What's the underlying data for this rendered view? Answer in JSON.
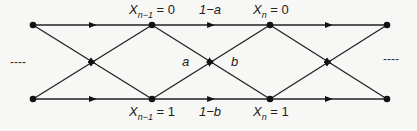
{
  "diagram": {
    "type": "state-transition-trellis",
    "colors": {
      "line": "#222222",
      "node": "#111111",
      "background": "#f7f7f5"
    },
    "nodes": [
      {
        "id": "left-top",
        "x": 33,
        "y": 25
      },
      {
        "id": "left-bottom",
        "x": 33,
        "y": 99
      },
      {
        "id": "prev-0",
        "x": 152,
        "y": 25,
        "label_var": "X",
        "label_sub": "n−1",
        "label_rest": " = 0"
      },
      {
        "id": "prev-1",
        "x": 152,
        "y": 99,
        "label_var": "X",
        "label_sub": "n−1",
        "label_rest": " = 1"
      },
      {
        "id": "curr-0",
        "x": 270,
        "y": 25,
        "label_var": "X",
        "label_sub": "n",
        "label_rest": " = 0"
      },
      {
        "id": "curr-1",
        "x": 270,
        "y": 99,
        "label_var": "X",
        "label_sub": "n",
        "label_rest": " = 1"
      },
      {
        "id": "right-top",
        "x": 387,
        "y": 25
      },
      {
        "id": "right-bottom",
        "x": 387,
        "y": 99
      }
    ],
    "edges": [
      {
        "from": "left-top",
        "to": "prev-0"
      },
      {
        "from": "left-top",
        "to": "prev-1"
      },
      {
        "from": "left-bottom",
        "to": "prev-0"
      },
      {
        "from": "left-bottom",
        "to": "prev-1"
      },
      {
        "from": "prev-0",
        "to": "curr-0",
        "label": "1−a"
      },
      {
        "from": "prev-0",
        "to": "curr-1",
        "label": "a"
      },
      {
        "from": "prev-1",
        "to": "curr-0",
        "label": "b"
      },
      {
        "from": "prev-1",
        "to": "curr-1",
        "label": "1−b"
      },
      {
        "from": "curr-0",
        "to": "right-top"
      },
      {
        "from": "curr-0",
        "to": "right-bottom"
      },
      {
        "from": "curr-1",
        "to": "right-top"
      },
      {
        "from": "curr-1",
        "to": "right-bottom"
      }
    ],
    "labels": {
      "prev0": {
        "var": "X",
        "sub": "n−1",
        "rest": " = 0"
      },
      "prev1": {
        "var": "X",
        "sub": "n−1",
        "rest": " = 1"
      },
      "curr0": {
        "var": "X",
        "sub": "n",
        "rest": " = 0"
      },
      "curr1": {
        "var": "X",
        "sub": "n",
        "rest": " = 1"
      },
      "edge_top": "1−a",
      "edge_bottom": "1−b",
      "edge_cross_a": "a",
      "edge_cross_b": "b",
      "left_continuation": "----",
      "right_continuation": "----"
    }
  }
}
